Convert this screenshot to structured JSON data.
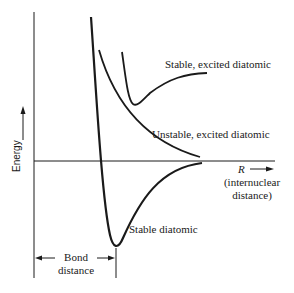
{
  "diagram": {
    "type": "potential-energy-curves",
    "axes": {
      "y_label": "Energy",
      "x_label_symbol": "R",
      "x_label_line1": "(internuclear",
      "x_label_line2": "distance)"
    },
    "curves": [
      {
        "name": "stable-excited-diatomic",
        "label": "Stable, excited diatomic"
      },
      {
        "name": "unstable-excited-diatomic",
        "label": "Unstable, excited diatomic"
      },
      {
        "name": "stable-diatomic",
        "label": "Stable diatomic"
      }
    ],
    "annotation": {
      "bond_distance_line1": "Bond",
      "bond_distance_line2": "distance"
    },
    "colors": {
      "line": "#1a1a1a",
      "background": "#ffffff"
    }
  }
}
